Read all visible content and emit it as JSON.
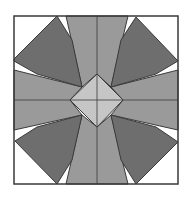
{
  "diagram": {
    "title": "",
    "type": "quilt-block",
    "colors": {
      "background": "#ffffff",
      "bar": "#9a9a9a",
      "corner": "#6e6e6e",
      "diamond": "#c6c6c6",
      "stroke": "#3a3a3a"
    },
    "frame": {
      "x": 14,
      "y": 16,
      "w": 164,
      "h": 168
    },
    "bars": [
      {
        "name": "bar-top",
        "points": "66,16 128,16 111,87 97,74 82,87"
      },
      {
        "name": "bar-bottom",
        "points": "82,115 97,127 111,115 128,184 66,184"
      },
      {
        "name": "bar-left",
        "points": "14,70 82,87 70,100 82,115 14,130"
      },
      {
        "name": "bar-right",
        "points": "178,70 178,130 111,115 123,100 111,87"
      }
    ],
    "corners": [
      {
        "name": "corner-top-left",
        "points": "57,16 72,40 82,87 37,74 14,61 14,59"
      },
      {
        "name": "corner-top-right",
        "points": "136,17 178,61 156,74 111,87 121,40"
      },
      {
        "name": "corner-bottom-left",
        "points": "82,115 72,160 57,184 15,141 37,127"
      },
      {
        "name": "corner-bottom-right",
        "points": "111,115 156,127 178,142 136,184 121,160"
      }
    ],
    "diamond": {
      "name": "center-diamond",
      "points": "97,74 123,100 97,127 70,100"
    },
    "seams": [
      {
        "name": "seam-vertical-top",
        "x1": 97,
        "y1": 16,
        "x2": 97,
        "y2": 74
      },
      {
        "name": "seam-vertical-bottom",
        "x1": 97,
        "y1": 127,
        "x2": 97,
        "y2": 184
      },
      {
        "name": "seam-horizontal-left",
        "x1": 14,
        "y1": 100,
        "x2": 70,
        "y2": 100
      },
      {
        "name": "seam-horizontal-right",
        "x1": 123,
        "y1": 100,
        "x2": 178,
        "y2": 100
      },
      {
        "name": "seam-diamond-vertical",
        "x1": 97,
        "y1": 74,
        "x2": 97,
        "y2": 127
      },
      {
        "name": "seam-diamond-horizontal",
        "x1": 70,
        "y1": 100,
        "x2": 123,
        "y2": 100
      }
    ]
  }
}
